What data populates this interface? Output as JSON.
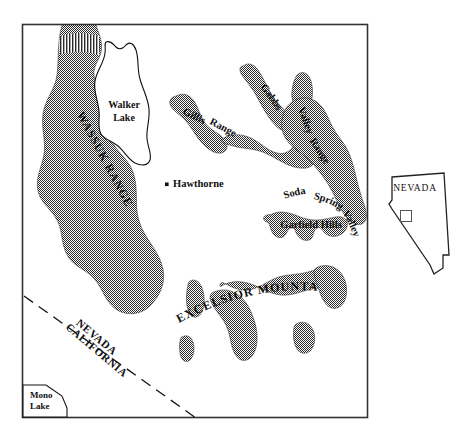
{
  "figure": {
    "kind": "reference-location-map",
    "region": "west-central Nevada",
    "frame": {
      "x": 22,
      "y": 24,
      "width": 346,
      "height": 394
    }
  },
  "main_map": {
    "ranges": [
      {
        "id": "wassuk-range",
        "label": "WASSUK  RANGE",
        "label_style": "uppercase-rotated",
        "rotation": 62,
        "x": 104,
        "y": 160,
        "font_size": 11.5,
        "letter_spacing": 1.1
      },
      {
        "id": "gillis-range",
        "label_parts": [
          "Gillis",
          "Range"
        ],
        "label": "Gillis Range",
        "label_style": "curved",
        "font_size": 10.5
      },
      {
        "id": "gabbs-valley-range",
        "label_parts": [
          "Gabbs",
          "Valley",
          "Range"
        ],
        "label": "Gabbs Valley Range",
        "label_style": "curved",
        "font_size": 10.5
      },
      {
        "id": "garfield-hills",
        "label": "Garfield Hills",
        "label_style": "horizontal",
        "x": 311,
        "y": 226,
        "font_size": 10.5
      },
      {
        "id": "excelsior-mountains",
        "label": "EXCELSIOR  MOUNTAINS",
        "label_style": "uppercase-arc",
        "x": 243,
        "y": 310,
        "font_size": 12,
        "letter_spacing": 1.2
      }
    ],
    "valleys": [
      {
        "id": "soda-spring-valley",
        "label_parts": [
          "Soda",
          "Spring",
          "Valley"
        ],
        "label": "Soda Spring Valley",
        "label_style": "curved",
        "font_size": 10.5
      }
    ],
    "lakes": [
      {
        "id": "walker-lake",
        "label_line1": "Walker",
        "label_line2": "Lake",
        "label": "Walker Lake",
        "x": 126,
        "y": 110,
        "font_size": 10,
        "bold": true
      },
      {
        "id": "mono-lake",
        "label_line1": "Mono",
        "label_line2": "Lake",
        "label": "Mono Lake",
        "x": 42,
        "y": 398,
        "font_size": 9,
        "bold": true
      }
    ],
    "settlements": [
      {
        "id": "hawthorne",
        "label": "Hawthorne",
        "marker": "square-dot",
        "x": 168,
        "y": 185,
        "font_size": 10.5,
        "bold": true
      }
    ],
    "boundaries": [
      {
        "id": "nevada-california-line",
        "style": "dashed",
        "label_line1": "NEVADA",
        "label_line2": "CALIFORNIA",
        "label": "NEVADA CALIFORNIA",
        "rotation": 40,
        "x": 96,
        "y": 344,
        "font_size": 11,
        "letter_spacing": 0.6
      }
    ]
  },
  "inset": {
    "id": "nevada-state-inset",
    "label": "NEVADA",
    "label_x": 415,
    "label_y": 188,
    "font_size": 9.5,
    "letter_spacing": 0.8,
    "locator_box": {
      "x": 401,
      "y": 211,
      "width": 11,
      "height": 11
    }
  },
  "colors": {
    "background": "#ffffff",
    "ink": "#000000",
    "frame_stroke": "#333333",
    "label_fill": "#111111",
    "stipple_dark": "#2b2b2b",
    "stipple_light": "#ffffff",
    "inset_stroke": "#222222"
  }
}
